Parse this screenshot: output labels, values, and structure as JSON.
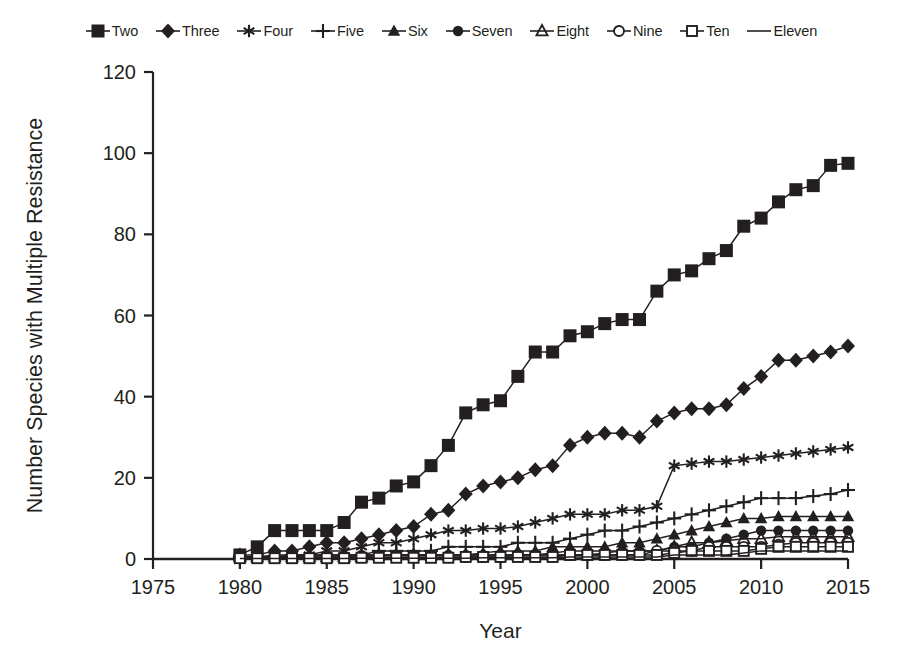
{
  "chart_data": {
    "type": "line",
    "title": "",
    "xlabel": "Year",
    "ylabel": "Number Species with Multiple Resistance",
    "xlim": [
      1975,
      2015
    ],
    "ylim": [
      0,
      120
    ],
    "xticks": [
      1975,
      1980,
      1985,
      1990,
      1995,
      2000,
      2005,
      2010,
      2015
    ],
    "yticks": [
      0,
      20,
      40,
      60,
      80,
      100,
      120
    ],
    "grid": false,
    "legend_position": "top",
    "x": [
      1980,
      1981,
      1982,
      1983,
      1984,
      1985,
      1986,
      1987,
      1988,
      1989,
      1990,
      1991,
      1992,
      1993,
      1994,
      1995,
      1996,
      1997,
      1998,
      1999,
      2000,
      2001,
      2002,
      2003,
      2004,
      2005,
      2006,
      2007,
      2008,
      2009,
      2010,
      2011,
      2012,
      2013,
      2014,
      2015
    ],
    "series": [
      {
        "name": "Two",
        "marker": "filled-square",
        "values": [
          1,
          3,
          7,
          7,
          7,
          7,
          9,
          14,
          15,
          18,
          19,
          23,
          28,
          36,
          38,
          39,
          45,
          51,
          51,
          55,
          56,
          58,
          59,
          59,
          66,
          70,
          71,
          74,
          76,
          82,
          84,
          88,
          91,
          92,
          97,
          97.5
        ]
      },
      {
        "name": "Three",
        "marker": "filled-diamond",
        "values": [
          1,
          1,
          2,
          2,
          3,
          4,
          4,
          5,
          6,
          7,
          8,
          11,
          12,
          16,
          18,
          19,
          20,
          22,
          23,
          28,
          30,
          31,
          31,
          30,
          34,
          36,
          37,
          37,
          38,
          42,
          45,
          49,
          49,
          50,
          51,
          52.5
        ]
      },
      {
        "name": "Four",
        "marker": "asterisk",
        "values": [
          0.5,
          0.5,
          1,
          1,
          1,
          2,
          2,
          3,
          4,
          4,
          5,
          6,
          7,
          7,
          7.5,
          7.5,
          8,
          9,
          10,
          11,
          11,
          11,
          12,
          12,
          13,
          23,
          23.5,
          24,
          24,
          24.5,
          25,
          25.5,
          26,
          26.5,
          27,
          27.5
        ]
      },
      {
        "name": "Five",
        "marker": "plus",
        "values": [
          0.5,
          0.5,
          0.5,
          1,
          1,
          1,
          1,
          1,
          2,
          2,
          2,
          2,
          3,
          3,
          3,
          3,
          4,
          4,
          4,
          5,
          6,
          7,
          7,
          8,
          9,
          10,
          11,
          12,
          13,
          14,
          15,
          15,
          15,
          15.5,
          16,
          17
        ]
      },
      {
        "name": "Six",
        "marker": "filled-triangle",
        "values": [
          0.5,
          0.5,
          0.5,
          0.5,
          1,
          1,
          1,
          1,
          1,
          1,
          1,
          1,
          1,
          1,
          1.5,
          2,
          2,
          2,
          3,
          3,
          3,
          3,
          4,
          4,
          5,
          6,
          7,
          8,
          9,
          10,
          10,
          10.5,
          10.5,
          10.5,
          10.5,
          10.5
        ]
      },
      {
        "name": "Seven",
        "marker": "filled-circle",
        "values": [
          0.5,
          0.5,
          0.5,
          0.5,
          0.5,
          0.5,
          0.5,
          1,
          1,
          1,
          1,
          1,
          1,
          1,
          1,
          1,
          1,
          1,
          1.5,
          2,
          2,
          2,
          2,
          2,
          2,
          3,
          3,
          4,
          5,
          6,
          7,
          7,
          7,
          7,
          7,
          7
        ]
      },
      {
        "name": "Eight",
        "marker": "open-triangle",
        "values": [
          0.5,
          0.5,
          0.5,
          0.5,
          0.5,
          0.5,
          0.5,
          0.5,
          1,
          1,
          1,
          1,
          1,
          1,
          1,
          1,
          1,
          1,
          1,
          1,
          1,
          1.5,
          2,
          2,
          2,
          3,
          4,
          4,
          4.5,
          5,
          5,
          5.5,
          5.5,
          5.5,
          5.5,
          5.5
        ]
      },
      {
        "name": "Nine",
        "marker": "open-circle",
        "values": [
          0.3,
          0.3,
          0.3,
          0.3,
          0.3,
          0.3,
          0.3,
          0.5,
          0.5,
          0.5,
          0.5,
          0.5,
          0.5,
          0.5,
          0.5,
          0.5,
          1,
          1,
          1,
          1,
          1,
          1,
          1,
          1,
          2,
          2,
          2,
          3,
          3,
          3,
          3,
          3.5,
          4,
          4,
          4,
          4
        ]
      },
      {
        "name": "Ten",
        "marker": "open-square",
        "values": [
          0.2,
          0.2,
          0.2,
          0.2,
          0.2,
          0.2,
          0.2,
          0.3,
          0.3,
          0.3,
          0.3,
          0.3,
          0.3,
          0.5,
          0.5,
          0.5,
          0.5,
          0.5,
          0.5,
          1,
          1,
          1,
          1,
          1,
          1,
          1.5,
          2,
          2,
          2,
          2,
          2.5,
          3,
          3,
          3,
          3,
          3
        ]
      },
      {
        "name": "Eleven",
        "marker": "none",
        "values": [
          0.1,
          0.1,
          0.1,
          0.1,
          0.1,
          0.1,
          0.1,
          0.2,
          0.2,
          0.2,
          0.2,
          0.2,
          0.2,
          0.2,
          0.3,
          0.3,
          0.3,
          0.3,
          0.3,
          0.5,
          0.5,
          0.5,
          0.5,
          0.5,
          0.5,
          1,
          1,
          1,
          1,
          1.5,
          2,
          2,
          2,
          2,
          2,
          2
        ]
      }
    ]
  },
  "legend": {
    "items": [
      {
        "label": "Two",
        "marker": "filled-square"
      },
      {
        "label": "Three",
        "marker": "filled-diamond"
      },
      {
        "label": "Four",
        "marker": "asterisk"
      },
      {
        "label": "Five",
        "marker": "plus"
      },
      {
        "label": "Six",
        "marker": "filled-triangle"
      },
      {
        "label": "Seven",
        "marker": "filled-circle"
      },
      {
        "label": "Eight",
        "marker": "open-triangle"
      },
      {
        "label": "Nine",
        "marker": "open-circle"
      },
      {
        "label": "Ten",
        "marker": "open-square"
      },
      {
        "label": "Eleven",
        "marker": "none"
      }
    ]
  },
  "colors": {
    "ink": "#231f20",
    "background": "#ffffff"
  }
}
